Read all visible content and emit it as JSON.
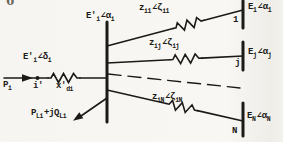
{
  "artifact": {
    "glyph": "6"
  },
  "machine": {
    "injection": {
      "base": "P",
      "sub": "i"
    },
    "emf": {
      "base": "E'",
      "base_sub": "i",
      "angle": "∠δ",
      "angle_sub": "i"
    },
    "node_label": "i'",
    "reactance": {
      "base": "x'",
      "sub": "di"
    }
  },
  "internal_bus": {
    "base": "E'",
    "base_sub": "i",
    "angle": "∠α",
    "angle_sub": "i"
  },
  "load": {
    "p_base": "P",
    "p_sub": "Li",
    "mid": "+jQ",
    "q_sub": "Li"
  },
  "branches": [
    {
      "imp_base": "z",
      "imp_sub": "i1",
      "imp_angle": "∠ζ",
      "imp_angle_sub": "i1",
      "bus_number": "1",
      "v_base": "E",
      "v_sub": "1",
      "v_angle": "∠α",
      "v_angle_sub": "1"
    },
    {
      "imp_base": "z",
      "imp_sub": "ij",
      "imp_angle": "∠ζ",
      "imp_angle_sub": "ij",
      "bus_number": "j",
      "v_base": "E",
      "v_sub": "j",
      "v_angle": "∠α",
      "v_angle_sub": "j"
    },
    {
      "imp_base": "z",
      "imp_sub": "iN",
      "imp_angle": "∠ζ",
      "imp_angle_sub": "iN",
      "bus_number": "N",
      "v_base": "E",
      "v_sub": "N",
      "v_angle": "∠α",
      "v_angle_sub": "N"
    }
  ],
  "colors": {
    "ink": "#1c1a17",
    "paper": "#f6f5f1"
  }
}
